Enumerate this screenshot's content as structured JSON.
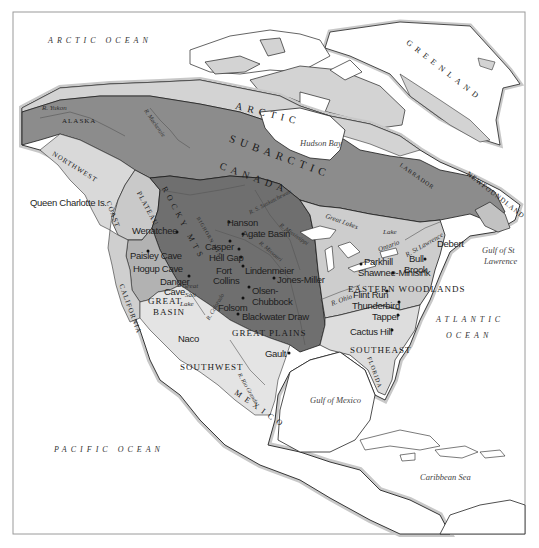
{
  "map": {
    "colors": {
      "ocean": "#ffffff",
      "coast_halo": "#c8c8c8",
      "land_outside": "#ffffff",
      "arctic": "#d3d3d3",
      "subarctic": "#8c8c8c",
      "northwest_coast": "#d9d9d9",
      "plateau": "#c9c9c9",
      "great_basin": "#b2b2b2",
      "great_plains": "#6f6f6f",
      "eastern_woodlands": "#cdcdcd",
      "southeast": "#dddddd",
      "southwest": "#e4e4e4",
      "california": "#cfcfcf",
      "newfoundland": "#c2c2c2"
    },
    "oceans": [
      {
        "id": "arctic-ocean",
        "label": "ARCTIC OCEAN"
      },
      {
        "id": "atlantic-ocean-1",
        "label": "ATLANTIC"
      },
      {
        "id": "atlantic-ocean-2",
        "label": "OCEAN"
      },
      {
        "id": "pacific-ocean",
        "label": "PACIFIC OCEAN"
      }
    ],
    "seas": [
      {
        "id": "hudson-bay",
        "label": "Hudson Bay"
      },
      {
        "id": "gulf-of-mexico",
        "label": "Gulf of Mexico"
      },
      {
        "id": "caribbean-sea",
        "label": "Caribbean Sea"
      },
      {
        "id": "gulf-st-lawrence-1",
        "label": "Gulf of St"
      },
      {
        "id": "gulf-st-lawrence-2",
        "label": "Lawrence"
      }
    ],
    "regions": [
      {
        "id": "arctic",
        "label": "ARCTIC"
      },
      {
        "id": "subarctic",
        "label": "SUBARCTIC"
      },
      {
        "id": "canada",
        "label": "CANADA"
      },
      {
        "id": "alaska",
        "label": "ALASKA"
      },
      {
        "id": "greenland",
        "label": "GREENLAND"
      },
      {
        "id": "labrador",
        "label": "LABRADOR"
      },
      {
        "id": "newfoundland",
        "label": "NEWFOUNDLAND"
      },
      {
        "id": "northwest-coast-1",
        "label": "NORTHWEST"
      },
      {
        "id": "northwest-coast-2",
        "label": "COAST"
      },
      {
        "id": "plateau",
        "label": "PLATEAU"
      },
      {
        "id": "rocky-mts",
        "label": "ROCKY MTS"
      },
      {
        "id": "bighorn-mts",
        "label": "BIGHORN MTS"
      },
      {
        "id": "great-basin-1",
        "label": "GREAT"
      },
      {
        "id": "great-basin-2",
        "label": "BASIN"
      },
      {
        "id": "california",
        "label": "CALIFORNIA"
      },
      {
        "id": "great-plains",
        "label": "GREAT PLAINS"
      },
      {
        "id": "eastern-woodlands",
        "label": "EASTERN WOODLANDS"
      },
      {
        "id": "southeast",
        "label": "SOUTHEAST"
      },
      {
        "id": "southwest",
        "label": "SOUTHWEST"
      },
      {
        "id": "mexico",
        "label": "MEXICO"
      },
      {
        "id": "florida",
        "label": "FLORIDA"
      },
      {
        "id": "great-salt-lake-1",
        "label": "Great"
      },
      {
        "id": "great-salt-lake-2",
        "label": "Salt"
      },
      {
        "id": "great-salt-lake-3",
        "label": "Lake"
      }
    ],
    "rivers": [
      {
        "id": "yukon",
        "label": "R. Yukon"
      },
      {
        "id": "mackenzie",
        "label": "R. Mackenzie"
      },
      {
        "id": "saskatchewan",
        "label": "R. S. Saskatchewan"
      },
      {
        "id": "missouri",
        "label": "R. Missouri"
      },
      {
        "id": "mississippi",
        "label": "R. Mississippi"
      },
      {
        "id": "colorado",
        "label": "R. Colorado"
      },
      {
        "id": "rio-grande",
        "label": "R. Rio Grande"
      },
      {
        "id": "ohio",
        "label": "R. Ohio"
      },
      {
        "id": "st-lawrence",
        "label": "R. St Lawrence"
      }
    ],
    "lakes": [
      {
        "id": "great-lakes",
        "label": "Great Lakes"
      },
      {
        "id": "lake-ontario-1",
        "label": "Lake"
      },
      {
        "id": "lake-ontario-2",
        "label": "Ontario"
      }
    ],
    "islands": [
      {
        "id": "queen-charlotte",
        "label": "Queen Charlotte Is."
      }
    ],
    "sites": [
      {
        "id": "wenatchee",
        "label": "Wenatchee"
      },
      {
        "id": "paisley-cave",
        "label": "Paisley Cave"
      },
      {
        "id": "hogup-cave",
        "label": "Hogup Cave"
      },
      {
        "id": "danger-cave-1",
        "label": "Danger"
      },
      {
        "id": "danger-cave-2",
        "label": "Cave"
      },
      {
        "id": "hanson",
        "label": "Hanson"
      },
      {
        "id": "agate-basin",
        "label": "Agate Basin"
      },
      {
        "id": "casper",
        "label": "Casper"
      },
      {
        "id": "hell-gap",
        "label": "Hell Gap"
      },
      {
        "id": "fort-collins-1",
        "label": "Fort"
      },
      {
        "id": "fort-collins-2",
        "label": "Collins"
      },
      {
        "id": "lindenmeier",
        "label": "Lindenmeier"
      },
      {
        "id": "jones-miller",
        "label": "Jones-Miller"
      },
      {
        "id": "olsen-chubbock-1",
        "label": "Olsen-"
      },
      {
        "id": "olsen-chubbock-2",
        "label": "Chubbock"
      },
      {
        "id": "folsom",
        "label": "Folsom"
      },
      {
        "id": "blackwater-draw",
        "label": "Blackwater Draw"
      },
      {
        "id": "naco",
        "label": "Naco"
      },
      {
        "id": "gault",
        "label": "Gault"
      },
      {
        "id": "parkhill",
        "label": "Parkhill"
      },
      {
        "id": "shawnee-minisink",
        "label": "Shawnee-Minisink"
      },
      {
        "id": "flint-run",
        "label": "Flint Run"
      },
      {
        "id": "thunderbird",
        "label": "Thunderbird"
      },
      {
        "id": "tapper",
        "label": "Tapper"
      },
      {
        "id": "cactus-hill",
        "label": "Cactus Hill"
      },
      {
        "id": "debert",
        "label": "Debert"
      },
      {
        "id": "bull-brook-1",
        "label": "Bull"
      },
      {
        "id": "bull-brook-2",
        "label": "Brook"
      }
    ]
  }
}
